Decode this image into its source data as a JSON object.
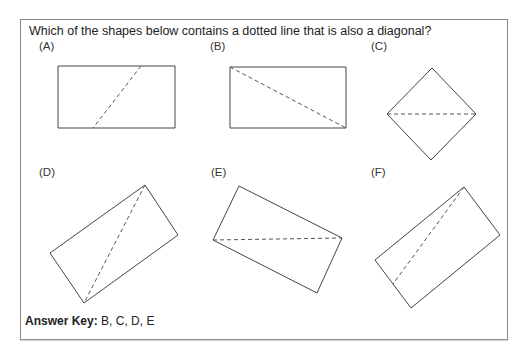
{
  "question": "Which of the shapes below contains a dotted line that is also a diagonal?",
  "options": [
    {
      "label": "(A)",
      "pos": [
        39,
        40
      ]
    },
    {
      "label": "(B)",
      "pos": [
        210,
        40
      ]
    },
    {
      "label": "(C)",
      "pos": [
        371,
        40
      ]
    },
    {
      "label": "(D)",
      "pos": [
        39,
        166
      ]
    },
    {
      "label": "(E)",
      "pos": [
        211,
        166
      ]
    },
    {
      "label": "(F)",
      "pos": [
        371,
        166
      ]
    }
  ],
  "shapes": {
    "A": {
      "type": "rectangle",
      "outline": "58,66 175,66 175,128 58,128",
      "dashed": [
        141,
        66,
        93,
        128
      ],
      "is_diagonal": false
    },
    "B": {
      "type": "rectangle",
      "outline": "230,67 346,67 346,128 230,128",
      "dashed": [
        230,
        67,
        346,
        128
      ],
      "is_diagonal": true
    },
    "C": {
      "type": "square-diamond",
      "outline": "432,68 476,114 431,160 387,114",
      "dashed": [
        387,
        114,
        476,
        114
      ],
      "is_diagonal": true
    },
    "D": {
      "type": "rotated-rectangle",
      "outline": "145,185 178,235 84,303 50,253",
      "dashed": [
        145,
        185,
        84,
        303
      ],
      "is_diagonal": true
    },
    "E": {
      "type": "rotated-rectangle",
      "outline": "239,186 342,238 317,293 213,240",
      "dashed": [
        213,
        240,
        342,
        238
      ],
      "is_diagonal": true
    },
    "F": {
      "type": "rotated-rectangle",
      "outline": "464,187 500,235 411,308 375,260",
      "dashed": [
        464,
        187,
        393,
        284
      ],
      "is_diagonal": false
    }
  },
  "answer_key": {
    "label": "Answer Key:",
    "value": " B, C, D, E"
  }
}
